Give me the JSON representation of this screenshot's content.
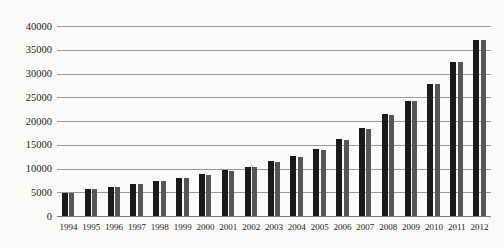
{
  "chart_data": {
    "type": "bar",
    "title": "",
    "xlabel": "",
    "ylabel": "",
    "categories": [
      "1994",
      "1995",
      "1996",
      "1997",
      "1998",
      "1999",
      "2000",
      "2001",
      "2002",
      "2003",
      "2004",
      "2005",
      "2006",
      "2007",
      "2008",
      "2009",
      "2010",
      "2011",
      "2012"
    ],
    "series": [
      {
        "name": "series-a-black",
        "color": "#1a1a1a",
        "values": [
          4900,
          5700,
          6200,
          6800,
          7400,
          8000,
          8800,
          9600,
          10400,
          11500,
          12700,
          14100,
          16300,
          18600,
          21500,
          24300,
          27800,
          32500,
          37000
        ]
      },
      {
        "name": "series-b-gray",
        "color": "#565656",
        "values": [
          4850,
          5600,
          6200,
          6700,
          7300,
          8000,
          8700,
          9500,
          10300,
          11400,
          12400,
          13900,
          16100,
          18400,
          21300,
          24300,
          27800,
          32500,
          37000
        ]
      }
    ],
    "ylim": [
      0,
      40000
    ],
    "ytick_interval": 5000,
    "yticks": [
      "0",
      "5000",
      "10000",
      "15000",
      "20000",
      "25000",
      "30000",
      "35000",
      "40000"
    ],
    "grid": true,
    "legend": "none"
  },
  "colors": {
    "background": "#fbfbf9",
    "gridline": "#9a9a9a",
    "axis_line": "#7d7d7d",
    "tick_text": "#1b1b1b",
    "bar_black": "#1a1a1a",
    "bar_gray": "#565656"
  }
}
